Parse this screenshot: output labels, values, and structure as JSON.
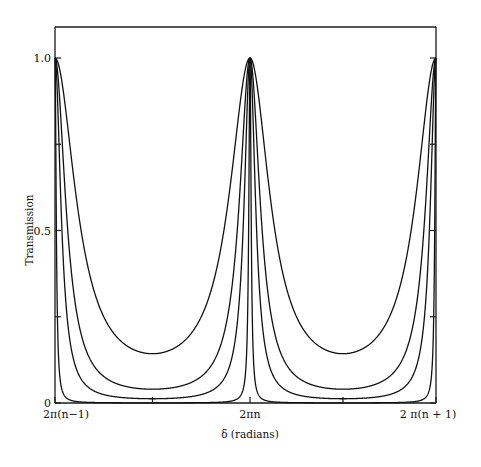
{
  "chart_data": {
    "type": "line",
    "title": "",
    "xlabel": "δ (radians)",
    "ylabel": "Transmission",
    "xlim": [
      -1,
      1
    ],
    "xlim_units": "multiples of 2π relative to 2πn",
    "ylim": [
      0,
      1.0
    ],
    "grid": false,
    "legend": "none",
    "x_ticks": [
      {
        "value": -1,
        "label": "2π(n−1)"
      },
      {
        "value": -0.5,
        "label": ""
      },
      {
        "value": 0,
        "label": "2πn"
      },
      {
        "value": 0.5,
        "label": ""
      },
      {
        "value": 1,
        "label": "2 π(n + 1)"
      }
    ],
    "y_ticks": [
      {
        "value": 0,
        "label": "0"
      },
      {
        "value": 0.25,
        "label": ""
      },
      {
        "value": 0.5,
        "label": "0.5"
      },
      {
        "value": 0.75,
        "label": ""
      },
      {
        "value": 1.0,
        "label": "1.0"
      }
    ],
    "function": "T = 1 / (1 + F sin²(δ/2))",
    "series": [
      {
        "name": "curve-low-finesse",
        "coefficient_F": 6,
        "min_transmission": 0.14,
        "peak_transmission": 1.0
      },
      {
        "name": "curve-medium-finesse",
        "coefficient_F": 24,
        "min_transmission": 0.04,
        "peak_transmission": 1.0
      },
      {
        "name": "curve-high-finesse",
        "coefficient_F": 80,
        "min_transmission": 0.012,
        "peak_transmission": 1.0
      },
      {
        "name": "curve-very-high-finesse",
        "coefficient_F": 2000,
        "min_transmission": 0.0005,
        "peak_transmission": 1.0
      }
    ]
  }
}
